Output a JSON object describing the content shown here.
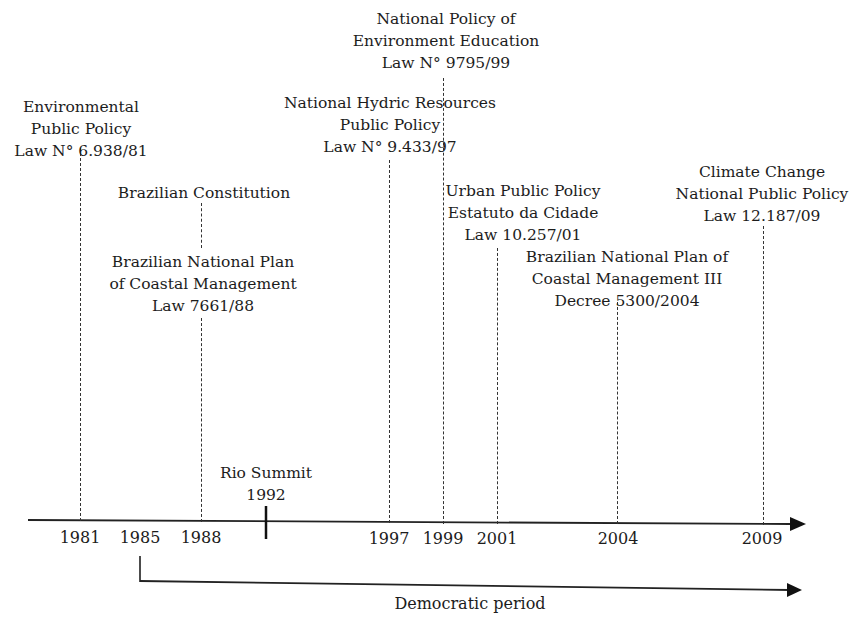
{
  "events": [
    {
      "id": "env-policy",
      "year": "1981",
      "lines": [
        "Environmental",
        "Public Policy",
        "Law N° 6.938/81"
      ]
    },
    {
      "id": "constitution",
      "year": "1988",
      "lines": [
        "Brazilian Constitution"
      ]
    },
    {
      "id": "coastal-plan",
      "year": "1988",
      "lines": [
        "Brazilian National Plan",
        "of Coastal Management",
        "Law 7661/88"
      ]
    },
    {
      "id": "hydric",
      "year": "1997",
      "lines": [
        "National Hydric Resources",
        "Public Policy",
        "Law N° 9.433/97"
      ]
    },
    {
      "id": "env-education",
      "year": "1999",
      "lines": [
        "National Policy of",
        "Environment Education",
        "Law N° 9795/99"
      ]
    },
    {
      "id": "urban",
      "year": "2001",
      "lines": [
        "Urban Public Policy",
        "Estatuto da Cidade",
        "Law 10.257/01"
      ]
    },
    {
      "id": "coastal-plan-3",
      "year": "2004",
      "lines": [
        "Brazilian National Plan of",
        "Coastal Management III",
        "Decree 5300/2004"
      ]
    },
    {
      "id": "climate",
      "year": "2009",
      "lines": [
        "Climate Change",
        "National Public Policy",
        "Law 12.187/09"
      ]
    },
    {
      "id": "rio-summit",
      "year": "1992",
      "lines": [
        "Rio Summit",
        "1992"
      ]
    }
  ],
  "axis": {
    "years": [
      "1981",
      "1985",
      "1988",
      "1997",
      "1999",
      "2001",
      "2004",
      "2009"
    ]
  },
  "period": {
    "label": "Democratic period",
    "start_year": "1985"
  }
}
